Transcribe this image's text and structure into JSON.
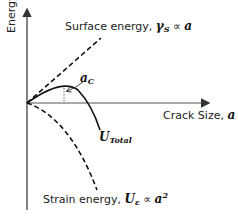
{
  "diagram": {
    "y_axis_label": "Energy",
    "x_axis_label_text": "Crack Size, ",
    "x_axis_label_var": "a",
    "surface_energy": {
      "text": "Surface energy, ",
      "symbol": "γ",
      "subscript": "S",
      "relation": " ∝ ",
      "var": "a"
    },
    "strain_energy": {
      "text": "Strain energy, ",
      "symbol": "U",
      "subscript": "ε",
      "relation": " ∝ ",
      "var": "a",
      "exponent": "2"
    },
    "total_energy": {
      "symbol": "U",
      "subscript": "Total"
    },
    "critical_size": {
      "symbol": "a",
      "subscript": "C"
    },
    "colors": {
      "line": "#111111",
      "axis": "#444444",
      "background": "#ffffff"
    }
  }
}
